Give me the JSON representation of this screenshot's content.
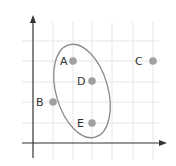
{
  "diagram": {
    "type": "scatter-grid-with-ellipse",
    "top_text_cutoff": "",
    "axes": {
      "origin": [
        33,
        143
      ],
      "x_axis_end": [
        167,
        143
      ],
      "y_axis_top": [
        33,
        15
      ],
      "y_axis_bottom": 158
    },
    "grid": {
      "x_lines": [
        53,
        73,
        92,
        112,
        133,
        153
      ],
      "y_lines": [
        41,
        61,
        82,
        102,
        123
      ],
      "x_min": 22,
      "x_max": 160,
      "y_min": 22,
      "y_max": 160,
      "color": "#e6e6e6"
    },
    "points": [
      {
        "id": "A",
        "label": "A",
        "cx": 73,
        "cy": 61,
        "label_x": 60,
        "label_y": 65
      },
      {
        "id": "B",
        "label": "B",
        "cx": 53,
        "cy": 102,
        "label_x": 36,
        "label_y": 106
      },
      {
        "id": "C",
        "label": "C",
        "cx": 153,
        "cy": 61,
        "label_x": 135,
        "label_y": 65
      },
      {
        "id": "D",
        "label": "D",
        "cx": 92,
        "cy": 81,
        "label_x": 77,
        "label_y": 85
      },
      {
        "id": "E",
        "label": "E",
        "cx": 92,
        "cy": 123,
        "label_x": 77,
        "label_y": 127
      }
    ],
    "ellipse": {
      "cx": 82,
      "cy": 91,
      "rx": 26,
      "ry": 48,
      "rotate": -16,
      "stroke": "#8a8a8a"
    },
    "colors": {
      "axis": "#333333",
      "point": "#a0a0a0",
      "label": "#333333"
    }
  }
}
